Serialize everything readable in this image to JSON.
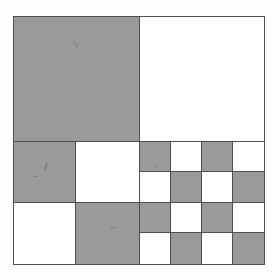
{
  "figure": {
    "shape": "square",
    "colors": {
      "fill_gray": "#9a9a9a",
      "fill_white": "#ffffff",
      "stroke": "#4f4f4f",
      "paper": "#fdfdfd"
    },
    "outer_border": true,
    "quadrants": [
      {
        "name": "top-left",
        "subdivision": 1,
        "pattern": "solid",
        "cells": [
          "gray"
        ]
      },
      {
        "name": "top-right",
        "subdivision": 1,
        "pattern": "solid",
        "cells": [
          "white"
        ]
      },
      {
        "name": "bottom-left",
        "subdivision": 2,
        "pattern": "checkerboard",
        "cells": [
          "gray",
          "white",
          "white",
          "gray"
        ]
      },
      {
        "name": "bottom-right",
        "subdivision": 4,
        "pattern": "checkerboard",
        "cells": [
          "gray",
          "white",
          "gray",
          "white",
          "white",
          "gray",
          "white",
          "gray",
          "gray",
          "white",
          "gray",
          "white",
          "white",
          "gray",
          "white",
          "gray"
        ]
      }
    ]
  },
  "chart_data": {
    "type": "heatmap",
    "xlabel": "",
    "ylabel": "",
    "grid": true,
    "legend": "none",
    "quadrant_subdivisions": [
      1,
      1,
      2,
      4
    ],
    "values": {
      "top_left": [
        [
          1
        ]
      ],
      "top_right": [
        [
          0
        ]
      ],
      "bottom_left": [
        [
          1,
          0
        ],
        [
          0,
          1
        ]
      ],
      "bottom_right": [
        [
          1,
          0,
          1,
          0
        ],
        [
          0,
          1,
          0,
          1
        ],
        [
          1,
          0,
          1,
          0
        ],
        [
          0,
          1,
          0,
          1
        ]
      ]
    },
    "value_map": {
      "0": "white",
      "1": "gray"
    }
  }
}
